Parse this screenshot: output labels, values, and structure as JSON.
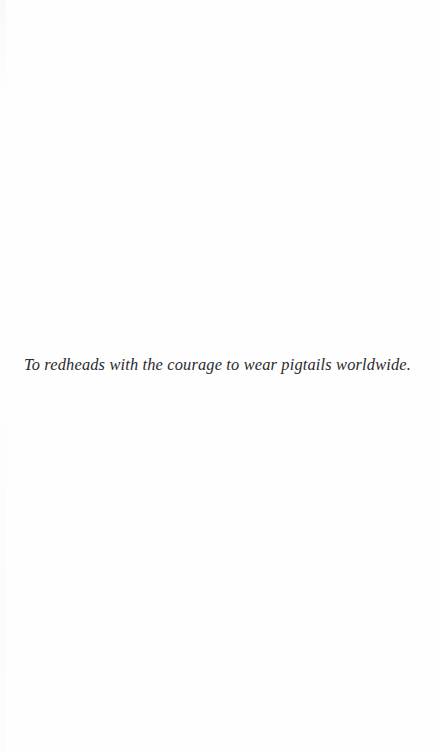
{
  "page": {
    "type": "book-dedication-page",
    "background_color": "#fefefe",
    "text_color": "#2a2a2c"
  },
  "dedication": {
    "text": "To redheads with the courage to wear pigtails worldwide."
  }
}
